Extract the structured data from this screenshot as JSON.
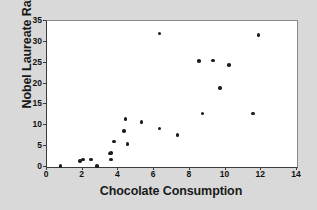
{
  "chart_data": {
    "type": "scatter",
    "title": "",
    "xlabel": "Chocolate Consumption",
    "ylabel": "Nobel Laureate Rate",
    "xlim": [
      0,
      14
    ],
    "ylim": [
      0,
      35
    ],
    "xticks": [
      0,
      2,
      4,
      6,
      8,
      10,
      12,
      14
    ],
    "yticks": [
      0,
      5,
      10,
      15,
      20,
      25,
      30,
      35
    ],
    "grid": false,
    "legend": null,
    "marker_color": "#1c1c1c",
    "plot_background": "#ffffff",
    "figure_background": "#d9d9d9",
    "points": [
      {
        "x": 0.75,
        "y": 0.2
      },
      {
        "x": 1.85,
        "y": 1.5
      },
      {
        "x": 2.0,
        "y": 1.8
      },
      {
        "x": 2.45,
        "y": 1.8
      },
      {
        "x": 2.8,
        "y": 0.2
      },
      {
        "x": 3.5,
        "y": 3.2
      },
      {
        "x": 3.6,
        "y": 3.3
      },
      {
        "x": 3.6,
        "y": 1.8
      },
      {
        "x": 3.75,
        "y": 6.1
      },
      {
        "x": 4.4,
        "y": 11.5
      },
      {
        "x": 4.3,
        "y": 8.6
      },
      {
        "x": 4.5,
        "y": 5.5
      },
      {
        "x": 5.3,
        "y": 10.8
      },
      {
        "x": 6.3,
        "y": 32.0
      },
      {
        "x": 6.3,
        "y": 9.2
      },
      {
        "x": 7.3,
        "y": 7.7
      },
      {
        "x": 8.5,
        "y": 25.4
      },
      {
        "x": 8.7,
        "y": 12.8
      },
      {
        "x": 9.3,
        "y": 25.5
      },
      {
        "x": 9.7,
        "y": 19.0
      },
      {
        "x": 10.2,
        "y": 24.4
      },
      {
        "x": 11.55,
        "y": 12.8
      },
      {
        "x": 11.85,
        "y": 31.6
      }
    ]
  }
}
